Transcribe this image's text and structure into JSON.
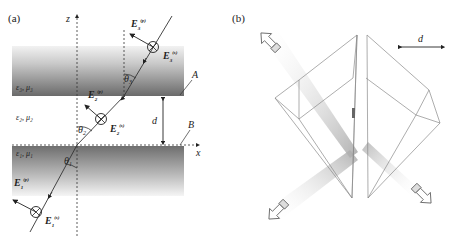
{
  "panel_a": {
    "label": "(a)",
    "axis_z": "z",
    "axis_x": "x",
    "layer3_params": "ε₃, μ₃",
    "layer2_params": "ε₂, μ₂",
    "layer1_params": "ε₁, μ₁",
    "interface_A": "A",
    "interface_B": "B",
    "gap_label": "d",
    "theta1": "θ",
    "theta1_sub": "1",
    "theta2": "θ",
    "theta2_sub": "2",
    "theta3": "θ",
    "theta3_sub": "3",
    "E1p": "E",
    "E1p_sub": "1",
    "E1p_sup": "(p)",
    "E1s": "E",
    "E1s_sub": "1",
    "E1s_sup": "(s)",
    "E2p": "E",
    "E2p_sub": "2",
    "E2p_sup": "(p)",
    "E2s": "E",
    "E2s_sub": "2",
    "E2s_sup": "(s)",
    "E3p": "E",
    "E3p_sub": "3",
    "E3p_sup": "(p)",
    "E3s": "E",
    "E3s_sub": "3",
    "E3s_sup": "(s)"
  },
  "panel_b": {
    "label": "(b)",
    "gap_label": "d"
  },
  "colors": {
    "slab_top": "#c8c8c8",
    "slab_bottom": "#6e6e6e",
    "line": "#333333",
    "prism_edge": "#8a8a8a",
    "beam": "#bdbdbd"
  }
}
